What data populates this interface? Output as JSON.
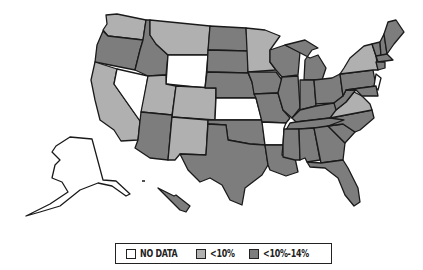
{
  "map": {
    "type": "choropleth",
    "region": "United States",
    "colors": {
      "no_data": "#ffffff",
      "lt10": "#b0b0b0",
      "10to14": "#7d7d7d",
      "border": "#1a1a1a"
    },
    "states": {
      "WA": "lt10",
      "OR": "10to14",
      "CA": "lt10",
      "NV": "no_data",
      "ID": "10to14",
      "MT": "lt10",
      "WY": "no_data",
      "UT": "lt10",
      "CO": "lt10",
      "AZ": "10to14",
      "NM": "lt10",
      "ND": "10to14",
      "SD": "10to14",
      "NE": "10to14",
      "KS": "no_data",
      "OK": "10to14",
      "TX": "10to14",
      "MN": "lt10",
      "IA": "10to14",
      "MO": "10to14",
      "AR": "no_data",
      "LA": "10to14",
      "WI": "10to14",
      "IL": "10to14",
      "MI": "10to14",
      "IN": "10to14",
      "OH": "10to14",
      "KY": "10to14",
      "TN": "10to14",
      "MS": "10to14",
      "AL": "10to14",
      "GA": "10to14",
      "FL": "10to14",
      "SC": "10to14",
      "NC": "10to14",
      "VA": "lt10",
      "WV": "10to14",
      "PA": "10to14",
      "NY": "lt10",
      "NJ": "no_data",
      "ME": "10to14",
      "NH": "10to14",
      "VT": "10to14",
      "MA": "10to14",
      "CT": "10to14",
      "MD": "10to14",
      "AK": "no_data",
      "HI": "10to14"
    }
  },
  "legend": {
    "items": [
      {
        "key": "no_data",
        "label": "NO DATA",
        "color": "#ffffff"
      },
      {
        "key": "lt10",
        "label": "<10%",
        "color": "#b0b0b0"
      },
      {
        "key": "10to14",
        "label": "<10%-14%",
        "color": "#7d7d7d"
      }
    ]
  }
}
